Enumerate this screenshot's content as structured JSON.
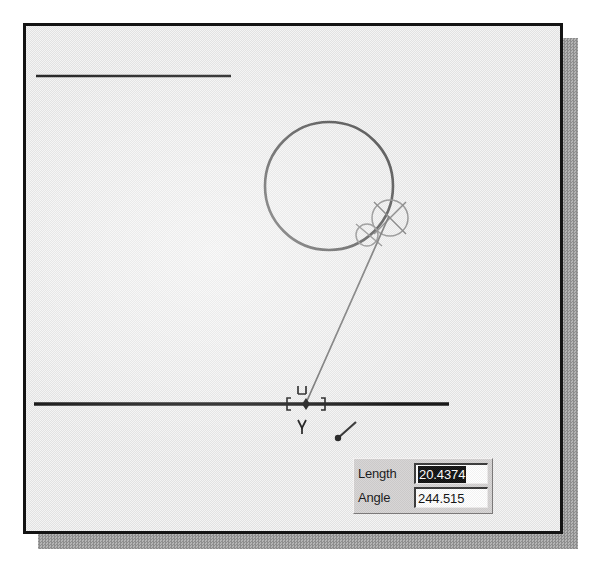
{
  "app": {
    "kind": "cad-drawing-viewport",
    "title": ""
  },
  "canvas": {
    "background_color": "#ececec",
    "frame_color": "#141414",
    "shadow_color": "#9a9a9a",
    "geometry": {
      "top_line": {
        "name": "top-horizontal-line",
        "x1": 10,
        "y1": 50,
        "x2": 205,
        "y2": 50,
        "stroke": "#2a2a2a",
        "width": 2.4
      },
      "bottom_line": {
        "name": "bottom-horizontal-line",
        "x1": 8,
        "y1": 378,
        "x2": 423,
        "y2": 378,
        "stroke": "#1a1a1a",
        "width": 3.2
      },
      "circle": {
        "name": "main-circle",
        "cx": 303,
        "cy": 160,
        "r": 64,
        "stroke": "#4a4a4a",
        "width": 2.4
      },
      "rubber_band_line": {
        "name": "rubber-band-line",
        "x1": 280,
        "y1": 378,
        "x2": 362,
        "y2": 192,
        "stroke": "#6a6a6a",
        "width": 1.6
      },
      "tangent_circle": {
        "name": "tangent-snap-circle",
        "cx": 363,
        "cy": 192,
        "r": 18,
        "stroke": "#8a8a8a",
        "width": 1.4
      },
      "tangent_circle_small": {
        "name": "tangent-snap-circle-small",
        "cx": 342,
        "cy": 208,
        "r": 11,
        "stroke": "#8a8a8a",
        "width": 1.4
      },
      "snap_marker": {
        "name": "midpoint-snap-marker",
        "cx": 280,
        "cy": 378,
        "stroke": "#1d1d1d"
      },
      "pencil_cursor": {
        "name": "pencil-cursor",
        "x": 312,
        "y": 398
      }
    }
  },
  "input_panel": {
    "name": "dynamic-input-panel",
    "fields": [
      {
        "label": "Length",
        "value": "20.4374",
        "selected": true,
        "name": "length-field"
      },
      {
        "label": "Angle",
        "value": "244.515",
        "selected": false,
        "name": "angle-field"
      }
    ]
  }
}
